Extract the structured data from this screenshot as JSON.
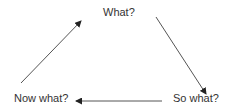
{
  "diagram": {
    "type": "cycle",
    "nodes": [
      {
        "id": "what",
        "label": "What?"
      },
      {
        "id": "so-what",
        "label": "So what?"
      },
      {
        "id": "now-what",
        "label": "Now what?"
      }
    ],
    "edges": [
      {
        "from": "what",
        "to": "so-what"
      },
      {
        "from": "so-what",
        "to": "now-what"
      },
      {
        "from": "now-what",
        "to": "what"
      }
    ],
    "colors": {
      "background": "#ffffff",
      "text": "#333333",
      "arrow_line": "#555555",
      "arrow_head": "#222222"
    }
  }
}
